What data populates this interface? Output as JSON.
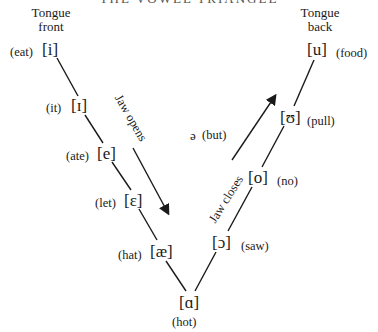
{
  "title": "THE VOWEL TRIANGLE",
  "headings": {
    "front": {
      "line1": "Tongue",
      "line2": "front"
    },
    "back": {
      "line1": "Tongue",
      "line2": "back"
    }
  },
  "front_vowels": [
    {
      "symbol": "[i]",
      "word": "(eat)"
    },
    {
      "symbol": "[ɪ]",
      "word": "(it)"
    },
    {
      "symbol": "[e]",
      "word": "(ate)"
    },
    {
      "symbol": "[ɛ]",
      "word": "(let)"
    },
    {
      "symbol": "[æ]",
      "word": "(hat)"
    }
  ],
  "low_vowel": {
    "symbol": "[ɑ]",
    "word": "(hot)"
  },
  "back_vowels": [
    {
      "symbol": "[ɔ]",
      "word": "(saw)"
    },
    {
      "symbol": "[o]",
      "word": "(no)"
    },
    {
      "symbol": "[ʊ]",
      "word": "(pull)"
    },
    {
      "symbol": "[u]",
      "word": "(food)"
    }
  ],
  "central_vowel": {
    "symbol": "ə",
    "word": "(but)"
  },
  "arrows": {
    "left": "Jaw opens",
    "right": "Jaw closes"
  }
}
